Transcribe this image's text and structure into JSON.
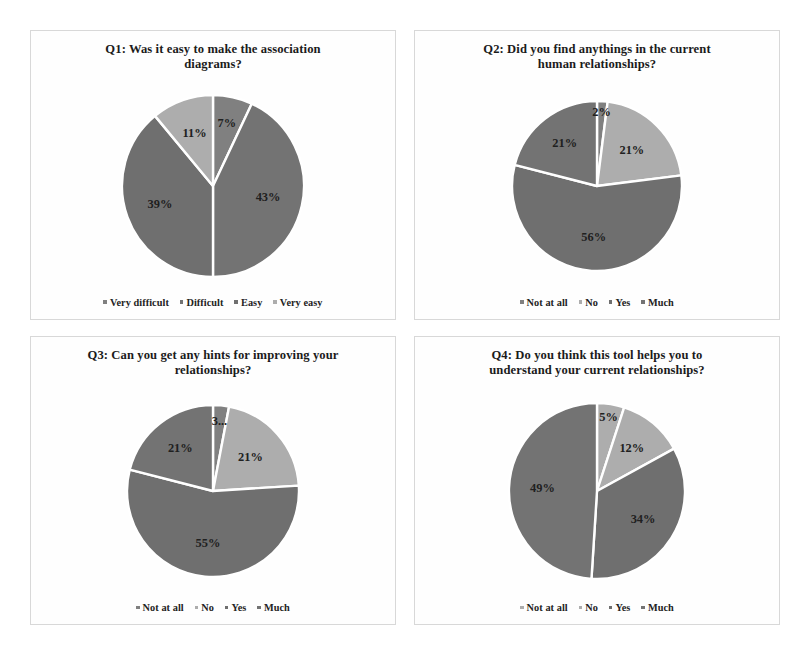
{
  "figure": {
    "background_color": "#ffffff",
    "panel_border_color": "#d8d8d8",
    "slice_separator_color": "#ffffff"
  },
  "palette": {
    "series_1": "#808080",
    "series_2": "#737373",
    "series_3": "#6f6f6f",
    "series_4": "#adadad"
  },
  "chart_data": [
    {
      "type": "pie",
      "id": "q1",
      "title": "Q1: Was it easy to make the association diagrams?",
      "categories": [
        "Very difficult",
        "Difficult",
        "Easy",
        "Very easy"
      ],
      "values": [
        7,
        43,
        39,
        11
      ],
      "labels": [
        "7%",
        "43%",
        "39%",
        "11%"
      ],
      "colors": [
        "#808080",
        "#737373",
        "#6f6f6f",
        "#adadad"
      ],
      "legend_position": "bottom",
      "start_angle": 0
    },
    {
      "type": "pie",
      "id": "q2",
      "title": "Q2: Did you find anythings in the current human relationships?",
      "categories": [
        "Not at all",
        "No",
        "Yes",
        "Much"
      ],
      "values": [
        2,
        21,
        56,
        21
      ],
      "labels": [
        "2%",
        "21%",
        "56%",
        "21%"
      ],
      "colors": [
        "#808080",
        "#adadad",
        "#6f6f6f",
        "#737373"
      ],
      "legend_position": "bottom",
      "start_angle": 0
    },
    {
      "type": "pie",
      "id": "q3",
      "title": "Q3: Can you get any hints for improving your relationships?",
      "categories": [
        "Not at all",
        "No",
        "Yes",
        "Much"
      ],
      "values": [
        3,
        21,
        55,
        21
      ],
      "labels": [
        "3...",
        "21%",
        "55%",
        "21%"
      ],
      "colors": [
        "#808080",
        "#adadad",
        "#6f6f6f",
        "#737373"
      ],
      "legend_position": "bottom",
      "start_angle": 0
    },
    {
      "type": "pie",
      "id": "q4",
      "title": "Q4: Do you think this tool helps you to understand your current relationships?",
      "categories": [
        "Not at all",
        "No",
        "Yes",
        "Much"
      ],
      "values": [
        5,
        12,
        34,
        49
      ],
      "labels": [
        "5%",
        "12%",
        "34%",
        "49%"
      ],
      "colors": [
        "#adadad",
        "#adadad",
        "#6f6f6f",
        "#737373"
      ],
      "legend_position": "bottom",
      "start_angle": 0
    }
  ],
  "panels": [
    {
      "title_line_1": "Q1: Was it easy to make the association",
      "title_line_2": "diagrams?"
    },
    {
      "title_line_1": "Q2: Did you find anythings in the current",
      "title_line_2": "human relationships?"
    },
    {
      "title_line_1": "Q3: Can you get any hints for improving your",
      "title_line_2": "relationships?"
    },
    {
      "title_line_1": "Q4: Do you think this tool helps you to",
      "title_line_2": "understand your current relationships?"
    }
  ]
}
